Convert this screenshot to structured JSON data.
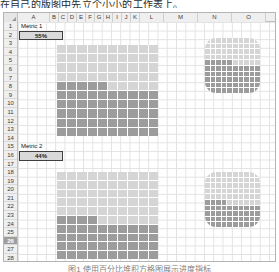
{
  "top_caption": "在自己的版图中先立个小小的工作表上。",
  "bottom_caption": "图1  使用百分比堆积方格图展示进度指标",
  "spreadsheet": {
    "column_headers": [
      "A",
      "B",
      "C",
      "D",
      "E",
      "F",
      "G",
      "H",
      "I",
      "J",
      "K",
      "L",
      "M",
      "N",
      "O"
    ],
    "column_widths": [
      32,
      9,
      9,
      9,
      9,
      9,
      9,
      9,
      9,
      9,
      9,
      24,
      34,
      34,
      34
    ],
    "row_headers": [
      "1",
      "2",
      "3",
      "4",
      "5",
      "6",
      "7",
      "8",
      "9",
      "10",
      "11",
      "12",
      "13",
      "14",
      "15",
      "16",
      "17",
      "18",
      "19",
      "20",
      "21",
      "22",
      "23",
      "24",
      "25",
      "26",
      "27",
      "28"
    ],
    "selected_row": "26",
    "cells": [
      {
        "name": "metric-1-label",
        "ref": "A1",
        "row": 1,
        "text": "Metric 1",
        "style": "label"
      },
      {
        "name": "metric-1-value",
        "ref": "A2",
        "row": 2,
        "text": "55%",
        "style": "value"
      },
      {
        "name": "metric-2-label",
        "ref": "A15",
        "row": 15,
        "text": "Metric 2",
        "style": "label"
      },
      {
        "name": "metric-2-value",
        "ref": "A16",
        "row": 16,
        "text": "44%",
        "style": "value"
      }
    ]
  },
  "colors": {
    "filled_cell": "#9c9c9c",
    "empty_cell": "#d5d5d5",
    "grid_line": "#ffffff",
    "header_bg": "#efefef",
    "selection": "#9e9e9e"
  },
  "chart_data": [
    {
      "type": "waffle",
      "name": "metric-1-waffle-square",
      "title": "Metric 1",
      "value": 55,
      "total": 100,
      "unit": "%",
      "rows": 10,
      "cols": 10,
      "fill_direction": "bottom-up",
      "shape": "square",
      "filled_color": "#9c9c9c",
      "empty_color": "#d5d5d5",
      "position": {
        "left": 57,
        "top": 45,
        "width": 101,
        "height": 91
      }
    },
    {
      "type": "waffle",
      "name": "metric-1-waffle-rounded",
      "title": "Metric 1",
      "value": 55,
      "total": 100,
      "unit": "%",
      "rows": 10,
      "cols": 10,
      "fill_direction": "bottom-up",
      "shape": "rounded",
      "filled_color": "#9c9c9c",
      "empty_color": "#d5d5d5",
      "position": {
        "left": 205,
        "top": 38,
        "width": 55,
        "height": 55
      }
    },
    {
      "type": "waffle",
      "name": "metric-2-waffle-square",
      "title": "Metric 2",
      "value": 44,
      "total": 100,
      "unit": "%",
      "rows": 10,
      "cols": 10,
      "fill_direction": "bottom-up",
      "shape": "square",
      "filled_color": "#9c9c9c",
      "empty_color": "#d5d5d5",
      "position": {
        "left": 57,
        "top": 172,
        "width": 101,
        "height": 87
      }
    },
    {
      "type": "waffle",
      "name": "metric-2-waffle-rounded",
      "title": "Metric 2",
      "value": 44,
      "total": 100,
      "unit": "%",
      "rows": 10,
      "cols": 10,
      "fill_direction": "bottom-up",
      "shape": "rounded",
      "filled_color": "#9c9c9c",
      "empty_color": "#d5d5d5",
      "position": {
        "left": 205,
        "top": 172,
        "width": 55,
        "height": 55
      }
    }
  ]
}
